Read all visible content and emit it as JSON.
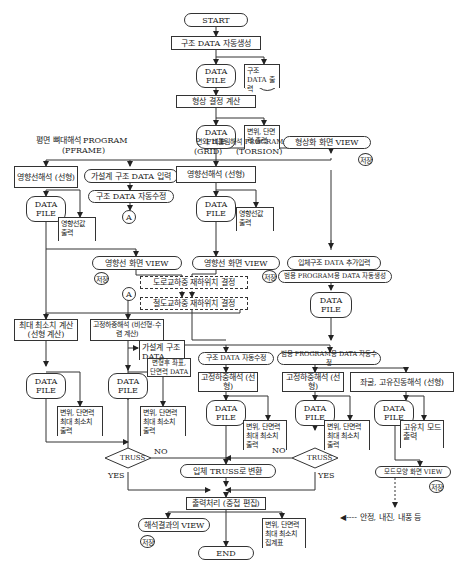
{
  "start": "START",
  "end": "END",
  "data_file": "DATA\nFILE",
  "steps": {
    "auto_gen": "구조 DATA 자동생성",
    "struct_out": "구조 DATA 출력",
    "shape_calc": "형상 결정 계산",
    "disp_out": "변위, 단면력 출력",
    "shape_view": "형상화 화면 VIEW",
    "pframe_title": "평면 뼈대해석 PROGRAM",
    "pframe_code": "(PFRAME)",
    "grid_title": "면외, 비틀림해석 PROGRAM",
    "grid_code": "(GRID)",
    "torsion_code": "(TORSION)",
    "inf_left": "영향선해석 (선형)",
    "assume_input": "가설계 구조 DATA 입력",
    "auto_fix": "구조 DATA 자동수정",
    "inf_mid": "영향선해석 (선형)",
    "inf_out_left": "영향선값 출력",
    "inf_out_mid": "영향선값 출력",
    "inf_view_left": "영향선 화면 VIEW",
    "inf_view_mid": "영향선 화면 VIEW",
    "road_load": "도로교하중 재하위치 결정",
    "rail_load": "철도교하중 재하위치 결정",
    "solid_add": "입체구조 DATA 추가입력",
    "gen_prog_gen": "범용 PROGRAM용 DATA 자동생성",
    "maxmin_calc": "최대 최소치 계산 (선형 계산)",
    "fixed_nonlin": "고정하중해석 (비선형-수렴 계산)",
    "assume_data": "가설계 구조 DATA",
    "deformed": "변형후 좌표, 단면력 DATA",
    "auto_fix2": "구조 DATA 자동수정",
    "gen_prog_fix": "범용 PROGRAM용 DATA 자동수정",
    "fixed_lin1": "고정하중해석 (선형)",
    "fixed_lin2": "고정하중해석 (선형)",
    "eigen": "좌굴, 고유진동해석 (선형)",
    "maxmin_out": "변위, 단면력 최대 최소치 출력",
    "eigen_out": "고유치 모드 출력",
    "mode_view": "모드모양 화면 VIEW",
    "truss": "TRUSS",
    "yes": "YES",
    "no": "NO",
    "to_3d_truss": "입체 TRUSS로 변환",
    "output_proc": "출력처리 (중첩 편집)",
    "result_view": "해석결과의 VIEW",
    "maxmin_sum": "변위, 단면력 최대 최소치 집계표",
    "legend": "◀---- 안정, 내진, 내풍 등",
    "save": "저장",
    "connector": "A"
  }
}
